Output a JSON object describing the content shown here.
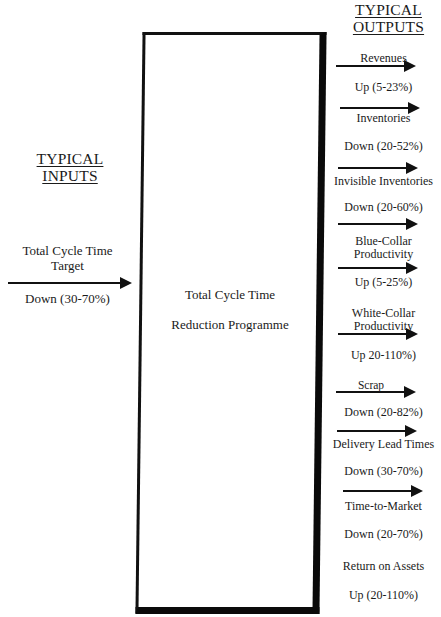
{
  "inputs": {
    "heading_line1": "TYPICAL",
    "heading_line2": "INPUTS",
    "items": [
      {
        "label_line1": "Total Cycle Time",
        "label_line2": "Target",
        "value": "Down (30-70%)"
      }
    ]
  },
  "process": {
    "line1": "Total Cycle Time",
    "line2": "Reduction Programme"
  },
  "outputs": {
    "heading_line1": "TYPICAL",
    "heading_line2": "OUTPUTS",
    "items": [
      {
        "label_line1": "Revenues",
        "label_line2": "",
        "value": "Up (5-23%)"
      },
      {
        "label_line1": "Inventories",
        "label_line2": "",
        "value": "Down (20-52%)"
      },
      {
        "label_line1": "Invisible Inventories",
        "label_line2": "",
        "value": "Down (20-60%)"
      },
      {
        "label_line1": "Blue-Collar",
        "label_line2": "Productivity",
        "value": "Up (5-25%)"
      },
      {
        "label_line1": "White-Collar",
        "label_line2": "Productivity",
        "value": "Up 20-110%)"
      },
      {
        "label_line1": "Scrap",
        "label_line2": "",
        "value": "Down (20-82%)"
      },
      {
        "label_line1": "Delivery Lead Times",
        "label_line2": "",
        "value": "Down (30-70%)"
      },
      {
        "label_line1": "Time-to-Market",
        "label_line2": "",
        "value": "Down (20-70%)"
      },
      {
        "label_line1": "Return on Assets",
        "label_line2": "",
        "value": "Up (20-110%)"
      }
    ]
  },
  "colors": {
    "ink": "#111111",
    "background": "#ffffff"
  }
}
